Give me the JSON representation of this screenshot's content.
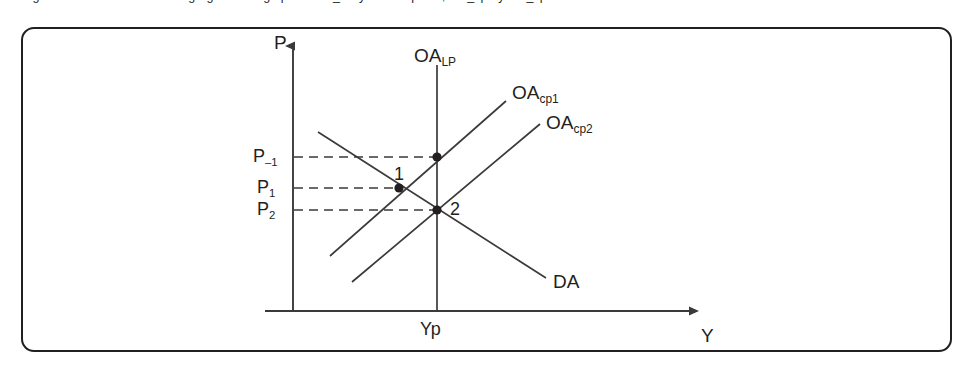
{
  "caption": {
    "figure_label": "Figura 20.4",
    "text": "Figura 20.4    Curva de oferta agregada a largo plazo OA_LP y a corto plazo, OA_cp1 y OA_cp2"
  },
  "figure": {
    "type": "economics-ad-as-diagram",
    "border_color": "#231f20",
    "line_color": "#3a3a3a",
    "background": "#ffffff"
  },
  "axes": {
    "y_axis_label": "P",
    "x_axis_label": "Y",
    "vertical_axis_x": 293,
    "horizontal_axis_y": 311
  },
  "curves": [
    {
      "id": "oa-lp",
      "label_main": "OA",
      "label_sub": "LP",
      "kind": "vertical-long-run-supply",
      "x": 437,
      "y_top": 65,
      "y_bottom": 311
    },
    {
      "id": "oa-cp1",
      "label_main": "OA",
      "label_sub": "cp1",
      "kind": "upward-short-run-supply",
      "from": [
        330,
        256
      ],
      "to": [
        506,
        101
      ]
    },
    {
      "id": "oa-cp2",
      "label_main": "OA",
      "label_sub": "cp2",
      "kind": "upward-short-run-supply",
      "from": [
        352,
        282
      ],
      "to": [
        540,
        124
      ]
    },
    {
      "id": "da",
      "label_main": "DA",
      "label_sub": "",
      "kind": "downward-aggregate-demand",
      "from": [
        318,
        132
      ],
      "to": [
        546,
        278
      ]
    }
  ],
  "price_levels": [
    {
      "id": "p-minus-1",
      "main": "P",
      "sub": "–1",
      "y": 157,
      "dash_to_x": 437
    },
    {
      "id": "p-1",
      "main": "P",
      "sub": "1",
      "y": 188,
      "dash_to_x": 399
    },
    {
      "id": "p-2",
      "main": "P",
      "sub": "2",
      "y": 210,
      "dash_to_x": 437
    }
  ],
  "output_ticks": [
    {
      "id": "yp",
      "label": "Yp",
      "x": 437
    }
  ],
  "equilibrium_points": [
    {
      "id": "point-top",
      "label": "",
      "x": 437,
      "y": 157
    },
    {
      "id": "point-1",
      "label": "1",
      "x": 399,
      "y": 188
    },
    {
      "id": "point-2",
      "label": "2",
      "x": 437,
      "y": 210
    }
  ]
}
